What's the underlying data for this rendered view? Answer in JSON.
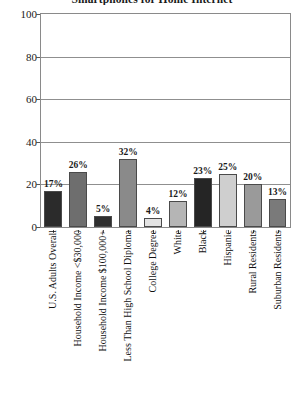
{
  "chart_data": {
    "type": "bar",
    "title": "Smartphones for Home Internet",
    "xlabel": "",
    "ylabel": "",
    "ylim": [
      0,
      100
    ],
    "yticks": [
      0,
      20,
      40,
      60,
      80,
      100
    ],
    "grid": true,
    "legend": "none",
    "value_suffix": "%",
    "categories": [
      "U.S. Adults Overall",
      "Household Income <$30,000",
      "Household Income $100,000+",
      "Less Than High School Diploma",
      "College Degree",
      "White",
      "Black",
      "Hispanic",
      "Rural Residents",
      "Suburban Residents"
    ],
    "values": [
      17,
      26,
      5,
      32,
      4,
      12,
      23,
      25,
      20,
      13
    ],
    "labels": [
      "17%",
      "26%",
      "5%",
      "32%",
      "4%",
      "12%",
      "23%",
      "25%",
      "20%",
      "13%"
    ],
    "bar_colors": [
      "#2b2b2b",
      "#6e6e6e",
      "#2f2f2f",
      "#8a8a8a",
      "#e3e3e3",
      "#b5b5b5",
      "#252525",
      "#cfcfcf",
      "#9a9a9a",
      "#7a7a7a"
    ],
    "colors": {
      "axis": "#8a8a8a",
      "grid": "#8f8f8f",
      "text": "#1a1a1a",
      "bar_edge": "#4a4a4a",
      "background": "#ffffff"
    }
  }
}
